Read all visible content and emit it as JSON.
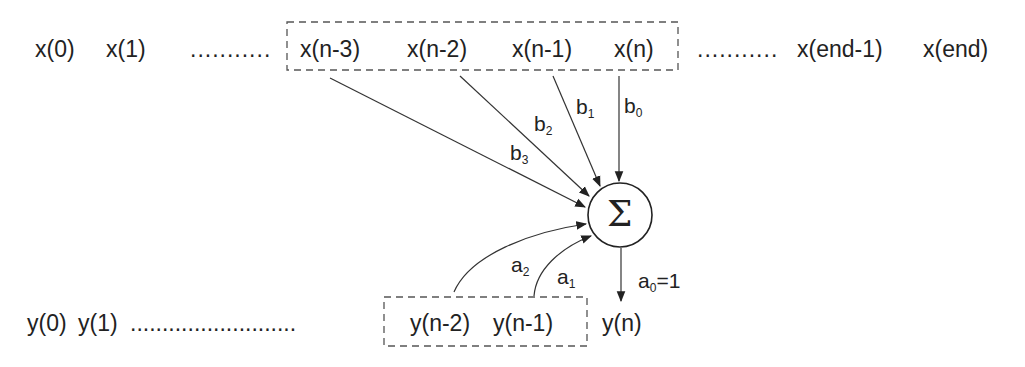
{
  "diagram": {
    "type": "IIR filter difference equation signal flow",
    "input_row": {
      "leading": [
        "x(0)",
        "x(1)"
      ],
      "dots_left": "...........",
      "window": [
        "x(n-3)",
        "x(n-2)",
        "x(n-1)",
        "x(n)"
      ],
      "dots_right": "...........",
      "trailing": [
        "x(end-1)",
        "x(end)"
      ]
    },
    "output_row": {
      "leading": [
        "y(0)",
        "y(1)"
      ],
      "dots_left": "..........................",
      "window": [
        "y(n-2)",
        "y(n-1)"
      ],
      "current": "y(n)"
    },
    "summation": {
      "symbol": "Σ"
    },
    "feedforward_coefficients": [
      {
        "base": "b",
        "sub": "0"
      },
      {
        "base": "b",
        "sub": "1"
      },
      {
        "base": "b",
        "sub": "2"
      },
      {
        "base": "b",
        "sub": "3"
      }
    ],
    "feedback_coefficients": [
      {
        "base": "a",
        "sub": "1"
      },
      {
        "base": "a",
        "sub": "2"
      }
    ],
    "output_coefficient": {
      "base": "a",
      "sub": "0",
      "suffix": "=1"
    },
    "colors": {
      "ink": "#222222",
      "dash": "#555555",
      "background": "#ffffff"
    }
  }
}
